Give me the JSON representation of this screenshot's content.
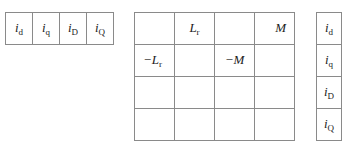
{
  "row_vector": [
    {
      "sym": "i",
      "sub": "d"
    },
    {
      "sym": "i",
      "sub": "q"
    },
    {
      "sym": "i",
      "sub": "D"
    },
    {
      "sym": "i",
      "sub": "Q"
    }
  ],
  "matrix": {
    "rows": [
      [
        {
          "sym": "",
          "sub": ""
        },
        {
          "sym": "L",
          "sub": "r"
        },
        {
          "sym": "",
          "sub": ""
        },
        {
          "sym": "M",
          "sub": ""
        }
      ],
      [
        {
          "sym": "−L",
          "sub": "r"
        },
        {
          "sym": "",
          "sub": ""
        },
        {
          "sym": "−M",
          "sub": ""
        },
        {
          "sym": "",
          "sub": ""
        }
      ],
      [
        {
          "sym": "",
          "sub": ""
        },
        {
          "sym": "",
          "sub": ""
        },
        {
          "sym": "",
          "sub": ""
        },
        {
          "sym": "",
          "sub": ""
        }
      ],
      [
        {
          "sym": "",
          "sub": ""
        },
        {
          "sym": "",
          "sub": ""
        },
        {
          "sym": "",
          "sub": ""
        },
        {
          "sym": "",
          "sub": ""
        }
      ]
    ]
  },
  "column_vector": [
    {
      "sym": "i",
      "sub": "d"
    },
    {
      "sym": "i",
      "sub": "q"
    },
    {
      "sym": "i",
      "sub": "D"
    },
    {
      "sym": "i",
      "sub": "Q"
    }
  ]
}
